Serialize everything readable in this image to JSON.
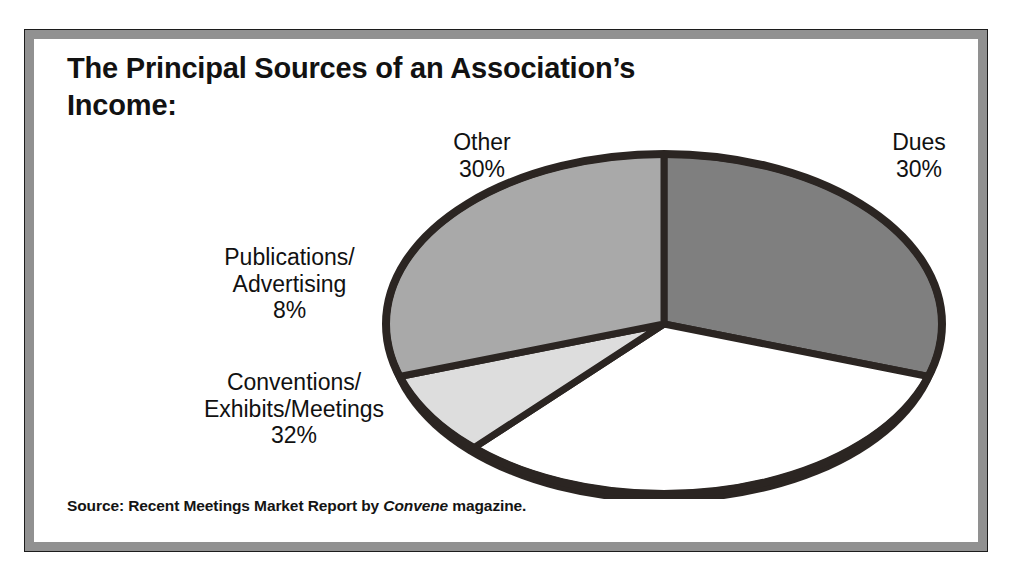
{
  "figure": {
    "title": "The Principal Sources of an Association’s\nIncome:",
    "source_prefix": "Source: Recent Meetings Market Report by ",
    "source_emphasis": "Convene",
    "source_suffix": " magazine.",
    "frame_color": "#919191",
    "frame_border_color": "#1c1c1c",
    "background_color": "#ffffff"
  },
  "labels": {
    "other": "Other\n30%",
    "dues": "Dues\n30%",
    "publications": "Publications/\nAdvertising\n8%",
    "conventions": "Conventions/\nExhibits/Meetings\n32%"
  },
  "chart_data": {
    "type": "pie",
    "title": "The Principal Sources of an Association’s Income:",
    "subtitle": "",
    "xlabel": "",
    "ylabel": "",
    "grid": false,
    "legend": "none",
    "label_position": "outside",
    "start_angle_deg": 0,
    "direction": "clockwise",
    "categories": [
      "Dues",
      "Conventions/Exhibits/Meetings",
      "Publications/Advertising",
      "Other"
    ],
    "values": [
      30,
      32,
      8,
      30
    ],
    "value_unit": "%",
    "total": 100,
    "slices": [
      {
        "label": "Dues",
        "value": 30,
        "display": "30%",
        "color": "#7f7f7f",
        "start_deg": 0,
        "end_deg": 108
      },
      {
        "label": "Conventions/Exhibits/Meetings",
        "value": 32,
        "display": "32%",
        "color": "#ffffff",
        "start_deg": 108,
        "end_deg": 223.2
      },
      {
        "label": "Publications/Advertising",
        "value": 8,
        "display": "8%",
        "color": "#dddddd",
        "start_deg": 223.2,
        "end_deg": 252
      },
      {
        "label": "Other",
        "value": 30,
        "display": "30%",
        "color": "#a9a9a9",
        "start_deg": 252,
        "end_deg": 360
      }
    ],
    "outline_color": "#2b2522",
    "annotations": [
      "Source: Recent Meetings Market Report by Convene magazine."
    ]
  }
}
